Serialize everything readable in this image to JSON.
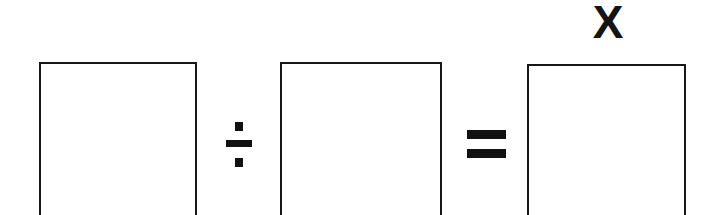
{
  "page": {
    "background_color": "#ffffff",
    "ink_color": "#171717",
    "width": 719,
    "height": 215
  },
  "equation": {
    "description": "blank-box division equation",
    "boxes": [
      {
        "id": "box-1",
        "label": "",
        "role": "dividend-blank"
      },
      {
        "id": "box-2",
        "label": "",
        "role": "divisor-blank"
      },
      {
        "id": "box-3",
        "label": "",
        "role": "quotient-blank"
      }
    ],
    "operators": [
      {
        "id": "divide",
        "symbol": "÷",
        "name": "division-sign"
      },
      {
        "id": "equals",
        "symbol": "=",
        "name": "equals-sign"
      }
    ],
    "annotations": [
      {
        "id": "unknown",
        "text": "X",
        "target": "box-3"
      }
    ]
  }
}
